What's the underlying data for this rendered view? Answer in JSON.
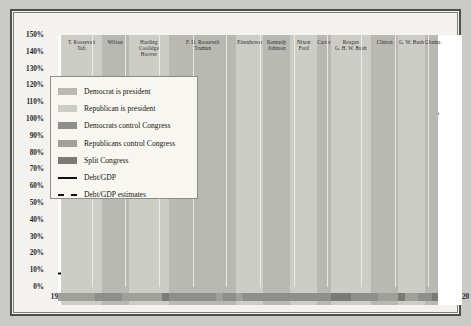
{
  "chart_data": {
    "type": "line",
    "title": "",
    "xlabel": "",
    "ylabel": "",
    "xlim": [
      1900,
      2020
    ],
    "ylim": [
      0,
      150
    ],
    "grid": true,
    "legend_position": "upper-left",
    "ytick_labels": [
      "0%",
      "10%",
      "20%",
      "30%",
      "40%",
      "50%",
      "60%",
      "70%",
      "80%",
      "90%",
      "100%",
      "110%",
      "120%",
      "130%",
      "140%",
      "150%"
    ],
    "ytick_values": [
      0,
      10,
      20,
      30,
      40,
      50,
      60,
      70,
      80,
      90,
      100,
      110,
      120,
      130,
      140,
      150
    ],
    "xtick_labels": [
      "1900",
      "1910",
      "1920",
      "1930",
      "1940",
      "1950",
      "1960",
      "1970",
      "1980",
      "1990",
      "2000",
      "2010",
      "2020"
    ],
    "xtick_values": [
      1900,
      1910,
      1920,
      1930,
      1940,
      1950,
      1960,
      1970,
      1980,
      1990,
      2000,
      2010,
      2020
    ],
    "series": [
      {
        "name": "Debt/GDP",
        "style": "solid",
        "color": "#111111",
        "x": [
          1900,
          1902,
          1904,
          1906,
          1908,
          1910,
          1912,
          1914,
          1916,
          1917,
          1918,
          1919,
          1920,
          1921,
          1922,
          1923,
          1924,
          1925,
          1926,
          1927,
          1928,
          1929,
          1930,
          1931,
          1932,
          1933,
          1934,
          1935,
          1936,
          1937,
          1938,
          1939,
          1940,
          1941,
          1942,
          1943,
          1944,
          1945,
          1946,
          1947,
          1948,
          1949,
          1950,
          1951,
          1952,
          1953,
          1954,
          1955,
          1956,
          1957,
          1958,
          1959,
          1960,
          1962,
          1964,
          1966,
          1968,
          1970,
          1972,
          1974,
          1976,
          1978,
          1980,
          1982,
          1984,
          1986,
          1988,
          1990,
          1992,
          1994,
          1996,
          1998,
          2000,
          2002,
          2004,
          2006,
          2008,
          2009,
          2010
        ],
        "y": [
          8,
          8,
          8,
          7.5,
          8,
          8,
          8,
          7.5,
          7.5,
          14,
          26,
          33,
          29,
          33,
          32,
          30,
          28,
          26,
          25,
          24,
          23,
          22,
          24,
          31,
          39,
          40,
          42,
          40,
          42,
          39,
          42,
          43,
          43,
          42,
          52,
          70,
          91,
          117,
          121,
          106,
          96,
          93,
          94,
          79,
          74,
          71,
          71,
          69,
          64,
          60,
          60,
          57,
          56,
          53,
          49,
          44,
          41,
          37,
          36,
          32,
          35,
          35,
          33,
          35,
          39,
          48,
          51,
          55,
          62,
          66,
          67,
          63,
          57,
          58,
          62,
          63,
          69,
          83,
          93
        ]
      },
      {
        "name": "Debt/GDP estimates",
        "style": "dashed",
        "color": "#111111",
        "x": [
          2010,
          2010.6,
          2011,
          2011.6,
          2012,
          2012.6,
          2013
        ],
        "y": [
          93,
          96,
          99,
          101,
          102.5,
          103,
          103.2
        ]
      }
    ],
    "president_bands": [
      {
        "label": "T. Roosevelt\nTaft",
        "start": 1901,
        "end": 1913,
        "party": "Republican"
      },
      {
        "label": "Wilson",
        "start": 1913,
        "end": 1921,
        "party": "Democrat"
      },
      {
        "label": "Harding\nCoolidge\nHoover",
        "start": 1921,
        "end": 1933,
        "party": "Republican"
      },
      {
        "label": "F. D. Roosevelt\nTruman",
        "start": 1933,
        "end": 1953,
        "party": "Democrat"
      },
      {
        "label": "Eisenhower",
        "start": 1953,
        "end": 1961,
        "party": "Republican"
      },
      {
        "label": "Kennedy\nJohnson",
        "start": 1961,
        "end": 1969,
        "party": "Democrat"
      },
      {
        "label": "Nixon\nFord",
        "start": 1969,
        "end": 1977,
        "party": "Republican"
      },
      {
        "label": "Carter",
        "start": 1977,
        "end": 1981,
        "party": "Democrat"
      },
      {
        "label": "Reagan\nG. H. W. Bush",
        "start": 1981,
        "end": 1993,
        "party": "Republican"
      },
      {
        "label": "Clinton",
        "start": 1993,
        "end": 2001,
        "party": "Democrat"
      },
      {
        "label": "G. W. Bush",
        "start": 2001,
        "end": 2009,
        "party": "Republican"
      },
      {
        "label": "Obama",
        "start": 2009,
        "end": 2013,
        "party": "Democrat"
      }
    ],
    "congress_bands": [
      {
        "start": 1900,
        "end": 1911,
        "control": "Republicans control Congress"
      },
      {
        "start": 1911,
        "end": 1919,
        "control": "Democrats control Congress"
      },
      {
        "start": 1919,
        "end": 1931,
        "control": "Republicans control Congress"
      },
      {
        "start": 1931,
        "end": 1933,
        "control": "Split Congress"
      },
      {
        "start": 1933,
        "end": 1947,
        "control": "Democrats control Congress"
      },
      {
        "start": 1947,
        "end": 1949,
        "control": "Republicans control Congress"
      },
      {
        "start": 1949,
        "end": 1953,
        "control": "Democrats control Congress"
      },
      {
        "start": 1953,
        "end": 1955,
        "control": "Republicans control Congress"
      },
      {
        "start": 1955,
        "end": 1981,
        "control": "Democrats control Congress"
      },
      {
        "start": 1981,
        "end": 1987,
        "control": "Split Congress"
      },
      {
        "start": 1987,
        "end": 1995,
        "control": "Democrats control Congress"
      },
      {
        "start": 1995,
        "end": 2001,
        "control": "Republicans control Congress"
      },
      {
        "start": 2001,
        "end": 2003,
        "control": "Split Congress"
      },
      {
        "start": 2003,
        "end": 2007,
        "control": "Republicans control Congress"
      },
      {
        "start": 2007,
        "end": 2011,
        "control": "Democrats control Congress"
      },
      {
        "start": 2011,
        "end": 2013,
        "control": "Split Congress"
      }
    ]
  },
  "legend": {
    "items": [
      {
        "label": "Democrat is president",
        "type": "swatch",
        "color": "#b9b9b4"
      },
      {
        "label": "Republican is president",
        "type": "swatch",
        "color": "#cdcdc8"
      },
      {
        "label": "Democrats control Congress",
        "type": "swatch",
        "color": "#8e8e8a"
      },
      {
        "label": "Republicans control Congress",
        "type": "swatch",
        "color": "#a0a09b"
      },
      {
        "label": "Split Congress",
        "type": "swatch",
        "color": "#7a7a76"
      },
      {
        "label": "Debt/GDP",
        "type": "line",
        "color": "#111111"
      },
      {
        "label": "Debt/GDP estimates",
        "type": "dashed-line",
        "color": "#111111"
      }
    ]
  },
  "colors": {
    "democrat_president": "#b9b9b4",
    "republican_president": "#cdcdc8",
    "democrats_congress": "#8e8e8a",
    "republicans_congress": "#a0a09b",
    "split_congress": "#7a7a76",
    "line": "#111111",
    "plot_background": "#ffffff",
    "figure_background": "#c9c9c6",
    "panel_background": "#f3f2ee"
  }
}
